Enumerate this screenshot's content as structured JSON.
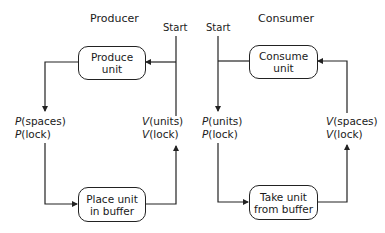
{
  "producer": {
    "title": "Producer",
    "start_label": "Start",
    "box_top": {
      "line1": "Produce",
      "line2": "unit"
    },
    "box_bottom": {
      "line1": "Place unit",
      "line2": "in buffer"
    },
    "left_ops": [
      {
        "op": "P",
        "arg": "(spaces)"
      },
      {
        "op": "P",
        "arg": "(lock)"
      }
    ],
    "right_ops": [
      {
        "op": "V",
        "arg": "(units)"
      },
      {
        "op": "V",
        "arg": "(lock)"
      }
    ]
  },
  "consumer": {
    "title": "Consumer",
    "start_label": "Start",
    "box_top": {
      "line1": "Consume",
      "line2": "unit"
    },
    "box_bottom": {
      "line1": "Take unit",
      "line2": "from buffer"
    },
    "left_ops": [
      {
        "op": "P",
        "arg": "(units)"
      },
      {
        "op": "P",
        "arg": "(lock)"
      }
    ],
    "right_ops": [
      {
        "op": "V",
        "arg": "(spaces)"
      },
      {
        "op": "V",
        "arg": "(lock)"
      }
    ]
  },
  "colors": {
    "line": "#222222",
    "background": "#ffffff"
  }
}
